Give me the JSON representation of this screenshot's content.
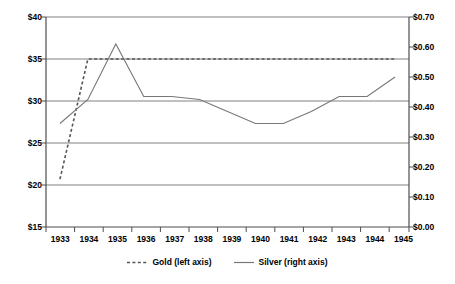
{
  "chart_data": {
    "type": "line",
    "title": "",
    "subtitle": "",
    "xlabel": "",
    "categories": [
      "1933",
      "1934",
      "1935",
      "1936",
      "1937",
      "1938",
      "1939",
      "1940",
      "1941",
      "1942",
      "1943",
      "1944",
      "1945"
    ],
    "grid": true,
    "legend_position": "bottom",
    "axes": {
      "left": {
        "label": "",
        "ylim": [
          15,
          40
        ],
        "ticks": [
          15,
          20,
          25,
          30,
          35,
          40
        ],
        "tick_labels": [
          "$15",
          "$20",
          "$25",
          "$30",
          "$35",
          "$40"
        ]
      },
      "right": {
        "label": "",
        "ylim": [
          0.0,
          0.7
        ],
        "ticks": [
          0.0,
          0.1,
          0.2,
          0.3,
          0.4,
          0.5,
          0.6,
          0.7
        ],
        "tick_labels": [
          "$0.00",
          "$0.10",
          "$0.20",
          "$0.30",
          "$0.40",
          "$0.50",
          "$0.60",
          "$0.70"
        ]
      }
    },
    "series": [
      {
        "name": "Gold (left axis)",
        "axis": "left",
        "style": "dashed",
        "color": "#555555",
        "values": [
          20.7,
          35.0,
          35.0,
          35.0,
          35.0,
          35.0,
          35.0,
          35.0,
          35.0,
          35.0,
          35.0,
          35.0,
          35.0
        ]
      },
      {
        "name": "Silver (right axis)",
        "axis": "right",
        "style": "solid",
        "color": "#777777",
        "values": [
          0.345,
          0.425,
          0.61,
          0.435,
          0.435,
          0.425,
          0.385,
          0.345,
          0.345,
          0.385,
          0.435,
          0.435,
          0.5
        ]
      }
    ]
  },
  "legend": {
    "items": [
      {
        "label": "Gold (left axis)",
        "style": "dashed"
      },
      {
        "label": "Silver (right axis)",
        "style": "solid"
      }
    ]
  },
  "colors": {
    "gold_line": "#555555",
    "silver_line": "#777777",
    "grid": "#808080",
    "axis": "#4d4d4d",
    "text": "#000000",
    "background": "#ffffff"
  }
}
